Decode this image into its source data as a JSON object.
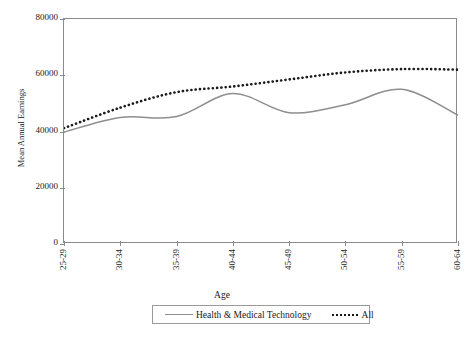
{
  "chart_data": {
    "type": "line",
    "title": "",
    "xlabel": "Age",
    "ylabel": "Mean Annual Earnings",
    "categories": [
      "25-29",
      "30-34",
      "35-39",
      "40-44",
      "45-49",
      "50-54",
      "55-59",
      "60-64"
    ],
    "series": [
      {
        "name": "Health & Medical Technology",
        "style": "solid",
        "color": "#8e8e8e",
        "values": [
          39800,
          45000,
          45300,
          53500,
          46700,
          49500,
          55000,
          45800
        ]
      },
      {
        "name": "All",
        "style": "dotted",
        "color": "#1a1a1a",
        "values": [
          41200,
          48500,
          54000,
          56000,
          58500,
          61000,
          62200,
          62000
        ]
      }
    ],
    "ylim": [
      0,
      80000
    ],
    "ytick_labels": [
      "0",
      "20000",
      "40000",
      "60000",
      "80000"
    ],
    "ytick_values": [
      0,
      20000,
      40000,
      60000,
      80000
    ],
    "grid": false,
    "legend_position": "bottom"
  },
  "axes": {
    "y_title": "Mean Annual Earnings",
    "x_title": "Age"
  },
  "legend": {
    "entries": [
      {
        "label": "Health & Medical Technology",
        "marker": "solid-line-swatch"
      },
      {
        "label": "All",
        "marker": "dotted-line-swatch"
      }
    ]
  },
  "colors": {
    "series_solid": "#8e8e8e",
    "series_dotted": "#1a1a1a",
    "axis": "#8b8b8b",
    "text": "#1a1a1a",
    "background": "#ffffff"
  }
}
